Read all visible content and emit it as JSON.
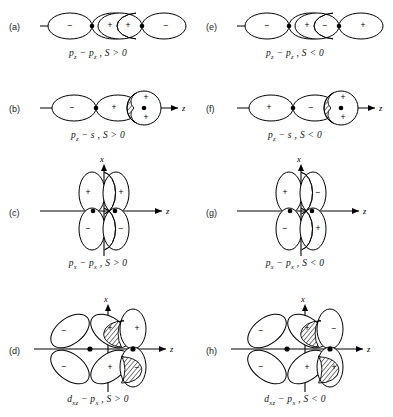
{
  "figure": {
    "columns": 2,
    "rows": 4,
    "stroke_color": "#000000",
    "background_color": "#ffffff",
    "hatch_color": "#000000"
  },
  "axis_labels": {
    "horizontal": "z",
    "vertical": "x"
  },
  "signs": {
    "positive": "+",
    "negative": "−"
  },
  "panels": [
    {
      "letter": "(a)",
      "name": "pz-pz-positive",
      "kind": "sigma-pair",
      "caption": "p₂ − p₂ , S > 0",
      "caption_parts": {
        "left_orbital": "p",
        "left_sub": "z",
        "right_orbital": "p",
        "right_sub": "z",
        "relation": "S > 0"
      },
      "lobe_signs": [
        "−",
        "+",
        "+",
        "−"
      ],
      "overlap_sign": "positive"
    },
    {
      "letter": "(e)",
      "name": "pz-pz-negative",
      "kind": "sigma-pair",
      "caption": "p₂ − p₂ , S < 0",
      "caption_parts": {
        "left_orbital": "p",
        "left_sub": "z",
        "right_orbital": "p",
        "right_sub": "z",
        "relation": "S < 0"
      },
      "lobe_signs": [
        "−",
        "+",
        "−",
        "+"
      ],
      "overlap_sign": "negative"
    },
    {
      "letter": "(b)",
      "name": "pz-s-positive",
      "kind": "p-s-pair",
      "caption": "p₂ − s , S > 0",
      "caption_parts": {
        "left_orbital": "p",
        "left_sub": "z",
        "right_orbital": "s",
        "right_sub": "",
        "relation": "S > 0"
      },
      "lobe_signs": [
        "−",
        "+"
      ],
      "s_signs": [
        "+",
        "+"
      ],
      "overlap_sign": "positive"
    },
    {
      "letter": "(f)",
      "name": "pz-s-negative",
      "kind": "p-s-pair",
      "caption": "p₂ − s , S < 0",
      "caption_parts": {
        "left_orbital": "p",
        "left_sub": "z",
        "right_orbital": "s",
        "right_sub": "",
        "relation": "S < 0"
      },
      "lobe_signs": [
        "+",
        "−"
      ],
      "s_signs": [
        "+",
        "+"
      ],
      "overlap_sign": "negative"
    },
    {
      "letter": "(c)",
      "name": "px-px-positive",
      "kind": "pi-pair",
      "caption": "pₓ − pₓ , S > 0",
      "caption_parts": {
        "left_orbital": "p",
        "left_sub": "x",
        "right_orbital": "p",
        "right_sub": "x",
        "relation": "S > 0"
      },
      "lobe_signs": [
        "+",
        "+",
        "−",
        "−"
      ],
      "overlap_sign": "positive"
    },
    {
      "letter": "(g)",
      "name": "px-px-negative",
      "kind": "pi-pair",
      "caption": "pₓ − pₓ , S < 0",
      "caption_parts": {
        "left_orbital": "p",
        "left_sub": "x",
        "right_orbital": "p",
        "right_sub": "x",
        "relation": "S < 0"
      },
      "lobe_signs": [
        "+",
        "−",
        "−",
        "+"
      ],
      "overlap_sign": "negative"
    },
    {
      "letter": "(d)",
      "name": "dxz-px-positive",
      "kind": "d-p-pair",
      "caption": "dₓ₂ − pₓ , S > 0",
      "caption_parts": {
        "left_orbital": "d",
        "left_sub": "xz",
        "right_orbital": "p",
        "right_sub": "x",
        "relation": "S > 0"
      },
      "d_lobe_signs": [
        "−",
        "+",
        "+",
        "−"
      ],
      "p_lobe_signs": [
        "+",
        "−"
      ],
      "overlap_sign": "positive"
    },
    {
      "letter": "(h)",
      "name": "dxz-px-negative",
      "kind": "d-p-pair",
      "caption": "dₓ₂ − pₓ , S < 0",
      "caption_parts": {
        "left_orbital": "d",
        "left_sub": "xz",
        "right_orbital": "p",
        "right_sub": "x",
        "relation": "S < 0"
      },
      "d_lobe_signs": [
        "−",
        "+",
        "+",
        "−"
      ],
      "p_lobe_signs": [
        "−",
        "+"
      ],
      "overlap_sign": "negative"
    }
  ]
}
